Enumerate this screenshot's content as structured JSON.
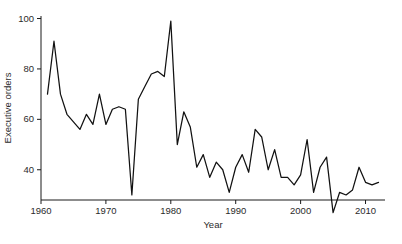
{
  "chart_data": {
    "type": "line",
    "title": "",
    "xlabel": "Year",
    "ylabel": "Executive orders",
    "xlim": [
      1960,
      2013
    ],
    "ylim": [
      28,
      101
    ],
    "grid": false,
    "legend": null,
    "xticks": [
      1960,
      1970,
      1980,
      1990,
      2000,
      2010
    ],
    "xtick_labels": [
      "1960",
      "1970",
      "1980",
      "1990",
      "2000",
      "2010"
    ],
    "yticks": [
      40,
      60,
      80,
      100
    ],
    "ytick_labels": [
      "40",
      "60",
      "80",
      "100"
    ],
    "series": [
      {
        "name": "Executive orders",
        "color": "#111111",
        "x": [
          1961,
          1962,
          1963,
          1964,
          1965,
          1966,
          1967,
          1968,
          1969,
          1970,
          1971,
          1972,
          1973,
          1974,
          1975,
          1976,
          1977,
          1978,
          1979,
          1980,
          1981,
          1982,
          1983,
          1984,
          1985,
          1986,
          1987,
          1988,
          1989,
          1990,
          1991,
          1992,
          1993,
          1994,
          1995,
          1996,
          1997,
          1998,
          1999,
          2000,
          2001,
          2002,
          2003,
          2004,
          2005,
          2006,
          2007,
          2008,
          2009,
          2010,
          2011,
          2012
        ],
        "values": [
          70,
          91,
          70,
          62,
          59,
          56,
          62,
          58,
          70,
          58,
          64,
          65,
          64,
          30,
          68,
          73,
          78,
          79,
          77,
          99,
          50,
          63,
          57,
          41,
          46,
          37,
          43,
          40,
          31,
          41,
          46,
          39,
          56,
          53,
          40,
          48,
          37,
          37,
          34,
          38,
          52,
          31,
          41,
          45,
          23,
          31,
          30,
          32,
          41,
          35,
          34,
          35
        ]
      }
    ]
  },
  "axes": {
    "y_label": "Executive orders",
    "x_label": "Year"
  }
}
